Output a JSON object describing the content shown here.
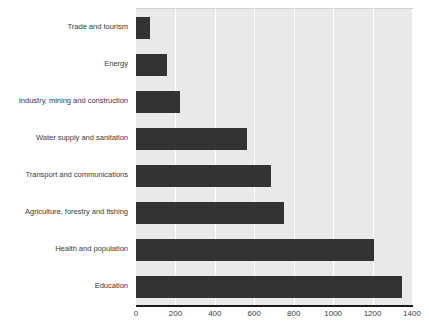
{
  "chart_data": {
    "type": "bar",
    "orientation": "horizontal",
    "title": "",
    "subtitle": "",
    "xlabel": "",
    "ylabel": "",
    "xlim": [
      0,
      1400
    ],
    "ylim": null,
    "grid": true,
    "legend": null,
    "legend_position": "none",
    "xticks": [
      0,
      200,
      400,
      600,
      800,
      1000,
      1200,
      1400
    ],
    "xtick_labels": [
      "0",
      "200",
      "400",
      "600",
      "800",
      "1000",
      "1200",
      "1400"
    ],
    "categories": [
      "Trade and tourism",
      "Energy",
      "Industry, mining and construction",
      "Water supply and sanitation",
      "Transport and communications",
      "Agriculture, forestry and fishing",
      "Health and population",
      "Education"
    ],
    "values": [
      70,
      155,
      225,
      565,
      685,
      750,
      1205,
      1350
    ],
    "series": [
      {
        "name": "",
        "values": [
          70,
          155,
          225,
          565,
          685,
          750,
          1205,
          1350
        ]
      }
    ],
    "colors": {
      "bar": "#333333",
      "plot_background": "#e9e9e9",
      "gridline": "#ffffff",
      "axis_line": "#1a1a1a",
      "text": "#3b3b3b"
    }
  }
}
